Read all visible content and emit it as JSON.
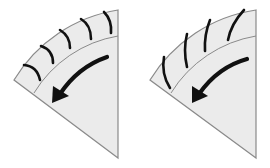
{
  "figure": {
    "colors": {
      "fill": "#ebebeb",
      "outline": "#8a8a8a",
      "ink": "#111111",
      "background": "#ffffff"
    },
    "panels": [
      {
        "id": "left",
        "label": "Curved tread grooves sector",
        "tread_style": "curved-arcs",
        "tread_count": 5,
        "arrow_direction": "counter-clockwise"
      },
      {
        "id": "right",
        "label": "Slanted tread grooves sector",
        "tread_style": "slanted-lines",
        "tread_count": 4,
        "arrow_direction": "counter-clockwise"
      }
    ]
  }
}
